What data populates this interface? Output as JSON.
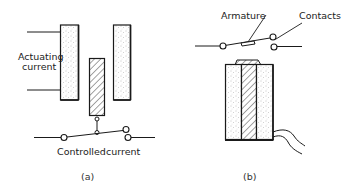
{
  "figure": {
    "panels": [
      {
        "id": "a",
        "caption": "(a)",
        "labels": {
          "actuating_line1": "Actuating",
          "actuating_line2": "current",
          "controlled_word1": "Controlled",
          "controlled_word2": "current"
        },
        "components": [
          "electromagnet-pole-left",
          "electromagnet-pole-right",
          "armature",
          "switch-contacts"
        ]
      },
      {
        "id": "b",
        "caption": "(b)",
        "labels": {
          "armature": "Armature",
          "contacts": "Contacts"
        },
        "components": [
          "coil",
          "core",
          "armature",
          "switch-contacts",
          "lead-wires"
        ]
      }
    ],
    "colors": {
      "stroke": "#1a1a1a",
      "stipple": "#9a9a9a",
      "background": "#ffffff"
    }
  }
}
